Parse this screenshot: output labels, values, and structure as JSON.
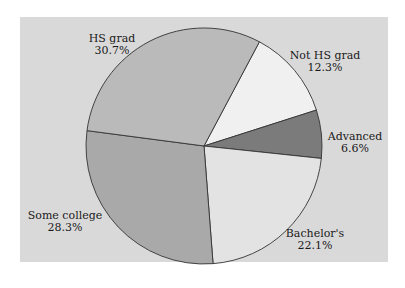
{
  "chart_data": {
    "type": "pie",
    "title": "",
    "categories": [
      "Not HS grad",
      "Advanced",
      "Bachelor's",
      "Some college",
      "HS grad"
    ],
    "values": [
      12.3,
      6.6,
      22.1,
      28.3,
      30.7
    ],
    "unit": "%",
    "start_angle_deg_clockwise_from_top": 28,
    "legend": "none (direct labels)",
    "colors": [
      "#f0f0f0",
      "#7b7b7b",
      "#e3e3e3",
      "#a9a9a9",
      "#bababa"
    ],
    "labels": [
      {
        "name": "HS grad",
        "pct": "30.7%"
      },
      {
        "name": "Not HS grad",
        "pct": "12.3%"
      },
      {
        "name": "Advanced",
        "pct": "6.6%"
      },
      {
        "name": "Some college",
        "pct": "28.3%"
      },
      {
        "name": "Bachelor's",
        "pct": "22.1%"
      }
    ]
  },
  "style": {
    "panel_background": "#d9d9d9",
    "outline": "#333333"
  }
}
